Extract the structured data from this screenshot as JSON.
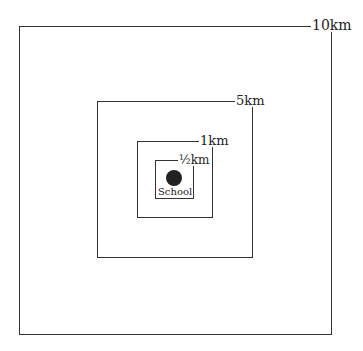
{
  "diagram": {
    "type": "concentric-distance-zones",
    "center": {
      "label": "School",
      "marker": "filled-circle"
    },
    "zones": [
      {
        "label": "10km"
      },
      {
        "label": "5km"
      },
      {
        "label": "1km"
      },
      {
        "label": "½km"
      }
    ],
    "colors": {
      "line": "#333333",
      "dot": "#222222",
      "background": "#ffffff"
    }
  }
}
